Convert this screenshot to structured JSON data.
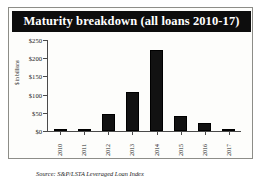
{
  "figure": {
    "title": "Maturity breakdown (all loans 2010-17)",
    "source_note": "Source: S&P/LSTA Leveraged Loan Index",
    "title_bar_color": "#0d0d0d",
    "bar_color": "#121212",
    "card_background": "#fdfdfb",
    "border_color": "#8d8d88"
  },
  "chart_data": {
    "type": "bar",
    "title": "Maturity breakdown (all loans 2010-17)",
    "xlabel": "",
    "ylabel": "$ in billions",
    "categories": [
      "2010",
      "2011",
      "2012",
      "2013",
      "2014",
      "2015",
      "2016",
      "2017"
    ],
    "values": [
      3,
      6,
      48,
      108,
      223,
      42,
      22,
      3
    ],
    "ylim": [
      0,
      250
    ],
    "yticks": [
      0,
      50,
      100,
      150,
      200,
      250
    ],
    "ytick_labels": [
      "$0",
      "$50",
      "$100",
      "$150",
      "$200",
      "$250"
    ],
    "grid": false,
    "legend": "none",
    "annotations": [
      "Source: S&P/LSTA Leveraged Loan Index"
    ]
  }
}
